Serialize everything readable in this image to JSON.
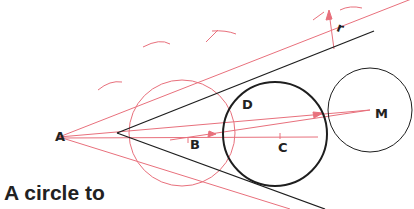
{
  "diagram": {
    "type": "geometric-construction",
    "colors": {
      "construction": "#e8707c",
      "main": "#1e1e1e",
      "background": "#ffffff"
    },
    "labels": {
      "A": "A",
      "B": "B",
      "C": "C",
      "D": "D",
      "M": "M",
      "r": "r"
    },
    "caption": "A circle to"
  }
}
